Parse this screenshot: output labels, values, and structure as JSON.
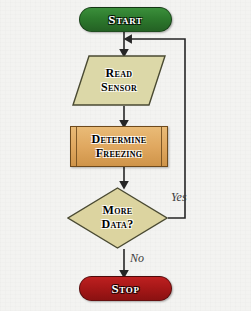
{
  "diagram": {
    "type": "flowchart",
    "background_color": "#f3f3f1",
    "nodes": [
      {
        "id": "start",
        "label": "Start",
        "shape": "terminator",
        "fill": "#2d7a2d",
        "text_color": "#ffffff"
      },
      {
        "id": "read_sensor",
        "label_line1": "Read",
        "label_line2": "Sensor",
        "shape": "parallelogram",
        "fill": "#dcd8a8",
        "text_color": "#000000"
      },
      {
        "id": "determine_freezing",
        "label_line1": "Determine",
        "label_line2": "Freezing",
        "shape": "predefined-process",
        "fill": "#e0a860",
        "text_color": "#000000"
      },
      {
        "id": "more_data",
        "label_line1": "More",
        "label_line2": "Data?",
        "shape": "diamond",
        "fill": "#dcd4a0",
        "text_color": "#000000"
      },
      {
        "id": "stop",
        "label": "Stop",
        "shape": "terminator",
        "fill": "#a81818",
        "text_color": "#ffffff"
      }
    ],
    "edges": [
      {
        "id": "start-to-read",
        "from": "start",
        "to": "read_sensor",
        "label": ""
      },
      {
        "id": "read-to-determine",
        "from": "read_sensor",
        "to": "determine_freezing",
        "label": ""
      },
      {
        "id": "determine-to-more",
        "from": "determine_freezing",
        "to": "more_data",
        "label": ""
      },
      {
        "id": "more-yes-loop",
        "from": "more_data",
        "to": "read_sensor",
        "label": "Yes"
      },
      {
        "id": "more-no-to-stop",
        "from": "more_data",
        "to": "stop",
        "label": "No"
      }
    ],
    "edge_color": "#262626",
    "labels": {
      "yes": "Yes",
      "no": "No"
    }
  }
}
